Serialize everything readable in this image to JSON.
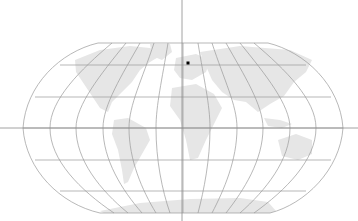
{
  "map": {
    "projection": "Robinson",
    "width": 358,
    "height": 221,
    "colors": {
      "background": "#ffffff",
      "land": "#e6e6e6",
      "graticule": "#9a9a9a",
      "crosshair": "#8c8c8c",
      "marker": "#000000"
    },
    "crosshair": {
      "x": 182,
      "y": 128
    },
    "marker": {
      "x": 188,
      "y": 63,
      "label": "location-marker"
    },
    "graticule": {
      "parallels_y": [
        43,
        65,
        97,
        128,
        160,
        191,
        213
      ],
      "meridian_count": 13
    }
  }
}
